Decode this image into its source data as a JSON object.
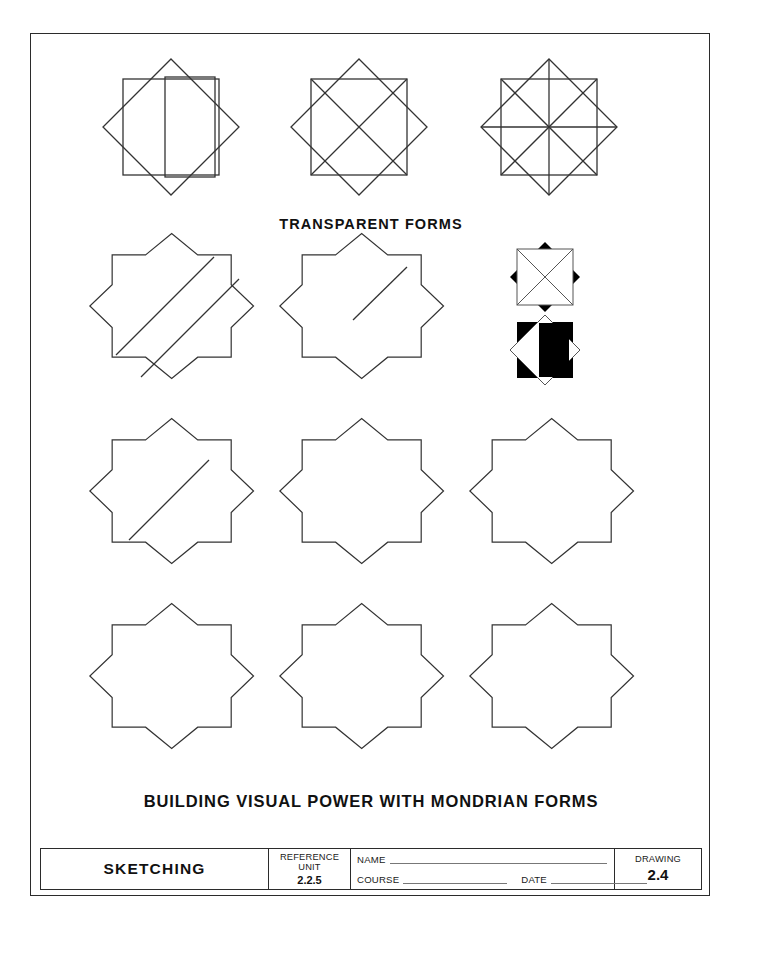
{
  "sheet": {
    "caption_top": "TRANSPARENT FORMS",
    "caption_bottom": "BUILDING VISUAL POWER WITH MONDRIAN FORMS",
    "line_color": "#333333",
    "fill_black": "#000000",
    "paper_color": "#ffffff"
  },
  "figures": {
    "row1": [
      {
        "name": "transparent-star-with-rectangle",
        "description": "Eight-point star of two overlapping squares with a transparent vertical rectangle overlaid"
      },
      {
        "name": "transparent-star-with-x-diagonals",
        "description": "Eight-point star with both diagonals of the upright square drawn as an X"
      },
      {
        "name": "transparent-star-with-full-radials",
        "description": "Eight-point star with all eight radial diagonals drawn through the centre"
      }
    ],
    "row2": [
      {
        "name": "star-with-diagonal-band",
        "description": "Star outline crossed by a wide diagonal band from lower-left to upper-right"
      },
      {
        "name": "star-with-half-diagonal",
        "description": "Star outline with a single diagonal line from centre to upper-right"
      },
      {
        "name": "solid-star-pair",
        "description": "Two small filled studies: black star points with white centre, and black square with white diamond and black bar"
      }
    ],
    "row3": [
      {
        "name": "star-with-short-diagonal",
        "description": "Plain star outline with one short diagonal stroke"
      },
      {
        "name": "blank-star-outline",
        "description": "Plain eight-point star outline"
      },
      {
        "name": "blank-star-outline",
        "description": "Plain eight-point star outline"
      }
    ],
    "row4": [
      {
        "name": "blank-star-outline",
        "description": "Plain eight-point star outline"
      },
      {
        "name": "blank-star-outline",
        "description": "Plain eight-point star outline"
      },
      {
        "name": "blank-star-outline",
        "description": "Plain eight-point star outline"
      }
    ]
  },
  "title_block": {
    "subject": "SKETCHING",
    "reference_label_line1": "REFERENCE",
    "reference_label_line2": "UNIT",
    "reference_value": "2.2.5",
    "name_label": "NAME",
    "name_value": "",
    "course_label": "COURSE",
    "course_value": "",
    "date_label": "DATE",
    "date_value": "",
    "drawing_label": "DRAWING",
    "drawing_value": "2.4"
  }
}
